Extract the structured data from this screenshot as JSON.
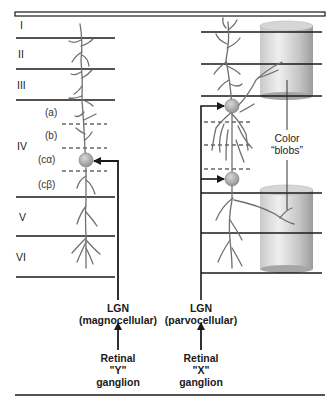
{
  "diagram": {
    "left_column": {
      "layers": [
        {
          "label": "I"
        },
        {
          "label": "II"
        },
        {
          "label": "III"
        },
        {
          "label": "IV"
        },
        {
          "label": "V"
        },
        {
          "label": "VI"
        }
      ],
      "sublayers": [
        {
          "label": "(a)"
        },
        {
          "label": "(b)"
        },
        {
          "label": "(cα)"
        },
        {
          "label": "(cβ)"
        }
      ],
      "input": {
        "line1": "LGN",
        "line2": "(magnocellular)"
      },
      "source": {
        "line1": "Retinal",
        "line2": "\"Y\"",
        "line3": "ganglion"
      }
    },
    "right_column": {
      "blob_label": {
        "line1": "Color",
        "line2": "“blobs”"
      },
      "input": {
        "line1": "LGN",
        "line2": "(parvocellular)"
      },
      "source": {
        "line1": "Retinal",
        "line2": "\"X\"",
        "line3": "ganglion"
      }
    },
    "colors": {
      "line": "#1a1a1a",
      "dendrite": "#6e6e6e",
      "soma": "#a8a8a8",
      "cylinder_light": "#e8e8e8",
      "cylinder_dark": "#9a9a9a"
    }
  }
}
